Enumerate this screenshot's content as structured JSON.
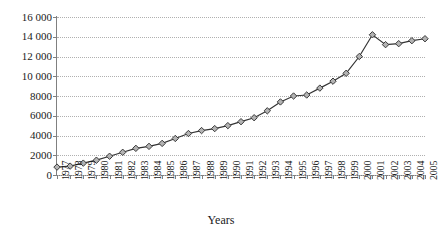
{
  "chart_data": {
    "type": "line",
    "title": "",
    "xlabel": "Years",
    "ylabel": "",
    "categories": [
      "1977",
      "1978",
      "1979",
      "1980",
      "1981",
      "1982",
      "1983",
      "1984",
      "1985",
      "1986",
      "1987",
      "1988",
      "1989",
      "1990",
      "1991",
      "1992",
      "1993",
      "1994",
      "1995",
      "1996",
      "1997",
      "1998",
      "1999",
      "2000",
      "2001",
      "2002",
      "2003",
      "2004",
      "2005"
    ],
    "values": [
      800,
      900,
      1200,
      1500,
      1900,
      2300,
      2700,
      2900,
      3200,
      3700,
      4200,
      4500,
      4700,
      5000,
      5400,
      5800,
      6500,
      7400,
      8000,
      8100,
      8800,
      9500,
      10300,
      12000,
      14200,
      13200,
      13300,
      13600,
      13800
    ],
    "series": [
      {
        "name": "series-1",
        "values": [
          800,
          900,
          1200,
          1500,
          1900,
          2300,
          2700,
          2900,
          3200,
          3700,
          4200,
          4500,
          4700,
          5000,
          5400,
          5800,
          6500,
          7400,
          8000,
          8100,
          8800,
          9500,
          10300,
          12000,
          14200,
          13200,
          13300,
          13600,
          13800
        ]
      }
    ],
    "ylim": [
      0,
      16000
    ],
    "y_ticks": [
      0,
      2000,
      4000,
      6000,
      8000,
      10000,
      12000,
      14000,
      16000
    ],
    "y_tick_labels": [
      "0",
      "2000",
      "4000",
      "6000",
      "8000",
      "10 000",
      "12 000",
      "14 000",
      "16 000"
    ],
    "grid": "horizontal-dotted",
    "legend": "none",
    "marker": "diamond",
    "colors": {
      "line": "#333333",
      "marker_fill": "#b3b3b3",
      "marker_stroke": "#3a3a3a",
      "axis": "#808080",
      "gridline": "#b0b0b0",
      "text": "#1a1a1a",
      "background": "#ffffff"
    }
  }
}
